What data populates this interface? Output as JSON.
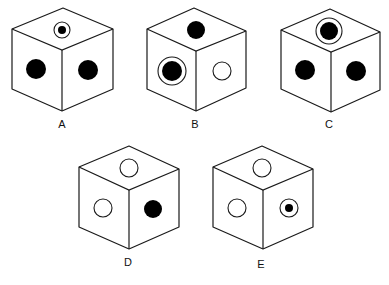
{
  "colors": {
    "stroke": "#1a1a1a",
    "fill_black": "#000000",
    "fill_white": "#ffffff"
  },
  "cubes": [
    {
      "label": "A",
      "geometry": {
        "top": [
          63,
          8
        ],
        "left": [
          12,
          29
        ],
        "center": [
          62,
          50
        ],
        "right": [
          113,
          29
        ],
        "left_bottom": [
          12,
          89
        ],
        "bottom": [
          62,
          111
        ],
        "right_bottom": [
          113,
          89
        ],
        "label_pos": [
          62,
          128
        ]
      },
      "faces": {
        "top": {
          "symbol": "ringed-black-dot",
          "cx": 62,
          "cy": 30,
          "r": 8,
          "dot_r": 4
        },
        "left": {
          "symbol": "black-dot",
          "cx": 36,
          "cy": 69,
          "r": 10
        },
        "right": {
          "symbol": "black-dot",
          "cx": 88,
          "cy": 70,
          "r": 10
        }
      }
    },
    {
      "label": "B",
      "geometry": {
        "top": [
          194,
          8
        ],
        "left": [
          147,
          29
        ],
        "center": [
          196,
          51
        ],
        "right": [
          246,
          31
        ],
        "left_bottom": [
          147,
          89
        ],
        "bottom": [
          196,
          111
        ],
        "right_bottom": [
          246,
          88
        ],
        "label_pos": [
          195,
          128
        ]
      },
      "faces": {
        "top": {
          "symbol": "black-dot",
          "cx": 196,
          "cy": 30,
          "r": 9
        },
        "left": {
          "symbol": "ringed-black-dot",
          "cx": 172,
          "cy": 71,
          "r": 14,
          "dot_r": 10
        },
        "right": {
          "symbol": "white-circle",
          "cx": 222,
          "cy": 71,
          "r": 9
        }
      }
    },
    {
      "label": "C",
      "geometry": {
        "top": [
          330,
          9
        ],
        "left": [
          281,
          30
        ],
        "center": [
          331,
          52
        ],
        "right": [
          380,
          32
        ],
        "left_bottom": [
          281,
          89
        ],
        "bottom": [
          331,
          112
        ],
        "right_bottom": [
          380,
          90
        ],
        "label_pos": [
          329,
          128
        ]
      },
      "faces": {
        "top": {
          "symbol": "ringed-black-dot",
          "cx": 329,
          "cy": 31,
          "r": 13,
          "dot_r": 9
        },
        "left": {
          "symbol": "black-dot",
          "cx": 305,
          "cy": 70,
          "r": 10
        },
        "right": {
          "symbol": "black-dot",
          "cx": 356,
          "cy": 71,
          "r": 10
        }
      }
    },
    {
      "label": "D",
      "geometry": {
        "top": [
          129,
          146
        ],
        "left": [
          79,
          167
        ],
        "center": [
          129,
          190
        ],
        "right": [
          179,
          169
        ],
        "left_bottom": [
          79,
          227
        ],
        "bottom": [
          129,
          249
        ],
        "right_bottom": [
          179,
          227
        ],
        "label_pos": [
          128,
          266
        ]
      },
      "faces": {
        "top": {
          "symbol": "white-circle",
          "cx": 129,
          "cy": 168,
          "r": 9
        },
        "left": {
          "symbol": "white-circle",
          "cx": 103,
          "cy": 208,
          "r": 9
        },
        "right": {
          "symbol": "black-dot",
          "cx": 153,
          "cy": 209,
          "r": 9
        }
      }
    },
    {
      "label": "E",
      "geometry": {
        "top": [
          262,
          146
        ],
        "left": [
          213,
          167
        ],
        "center": [
          263,
          190
        ],
        "right": [
          313,
          169
        ],
        "left_bottom": [
          213,
          227
        ],
        "bottom": [
          263,
          249
        ],
        "right_bottom": [
          313,
          227
        ],
        "label_pos": [
          261,
          268
        ]
      },
      "faces": {
        "top": {
          "symbol": "white-circle",
          "cx": 262,
          "cy": 168,
          "r": 9
        },
        "left": {
          "symbol": "white-circle",
          "cx": 237,
          "cy": 208,
          "r": 9
        },
        "right": {
          "symbol": "ringed-black-dot",
          "cx": 289,
          "cy": 208,
          "r": 9,
          "dot_r": 4
        }
      }
    }
  ]
}
